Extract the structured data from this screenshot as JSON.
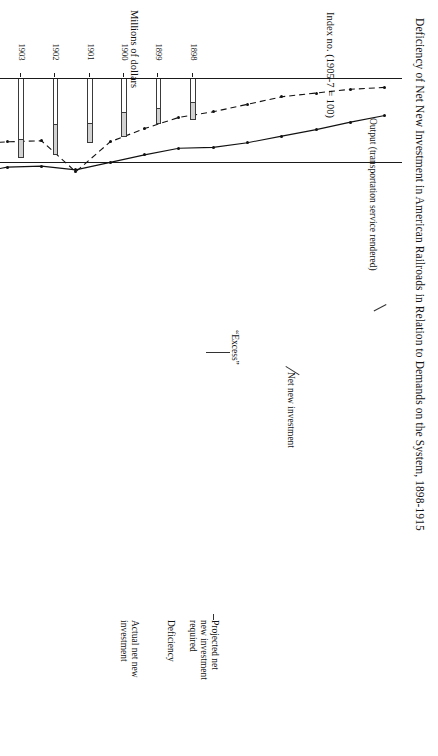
{
  "figure": {
    "title": "Deficiency of Net New Investment in American Railroads in Relation to Demands on the System, 1898-1915"
  },
  "line_panel": {
    "y_caption": "Index no. (1905-7 = 100)",
    "series_label_output": "Output (transportation service rendered)",
    "series_label_investment": "Net new investment"
  },
  "bar_panel": {
    "y_caption": "Millions of dollars",
    "label_projected": "Projected net\nnew investment\nrequired",
    "label_projected_l1": "Projected net",
    "label_projected_l2": "new investment",
    "label_projected_l3": "required",
    "label_deficiency": "Deficiency",
    "label_actual_l1": "Actual net new",
    "label_actual_l2": "investment",
    "label_excess": "“Excess”"
  },
  "chart_data": [
    {
      "type": "line",
      "title": "Index no. (1905-7 = 100)",
      "xlabel": "",
      "ylabel": "Index no. (1905-7 = 100)",
      "ylim": [
        10,
        170
      ],
      "yticks": [
        20,
        40,
        60,
        80,
        100,
        120,
        140,
        160
      ],
      "grid": false,
      "reference_line": 100,
      "legend": "inline annotations",
      "x": [
        1898,
        1899,
        1900,
        1901,
        1902,
        1903,
        1904,
        1905,
        1906,
        1907,
        1908,
        1909,
        1910,
        1911,
        1912,
        1913,
        1914,
        1915
      ],
      "series": [
        {
          "name": "Output (transportation service rendered)",
          "style": "solid",
          "values": [
            50,
            57,
            65,
            72,
            79,
            84,
            85,
            92,
            100,
            108,
            104,
            105,
            112,
            114,
            124,
            137,
            141,
            152
          ]
        },
        {
          "name": "Net new investment",
          "style": "dashed",
          "values": [
            20,
            22,
            26,
            30,
            38,
            46,
            52,
            64,
            78,
            110,
            77,
            78,
            80,
            81,
            44,
            67,
            55,
            74
          ]
        }
      ]
    },
    {
      "type": "bar",
      "subtype": "stacked",
      "title": "Millions of dollars",
      "xlabel": "",
      "ylabel": "Millions of dollars",
      "ylim": [
        0,
        1450
      ],
      "yticks": [
        200,
        400,
        600,
        800,
        1000,
        1200,
        1400
      ],
      "grid": false,
      "categories": [
        1898,
        1899,
        1900,
        1901,
        1902,
        1903,
        1904,
        1905,
        1906,
        1907,
        1908,
        1909,
        1910,
        1911,
        1912,
        1913,
        1914,
        1915
      ],
      "series": [
        {
          "name": "Actual net new investment",
          "fill": "white",
          "values": [
            240,
            300,
            330,
            440,
            450,
            590,
            600,
            650,
            770,
            1020,
            560,
            600,
            620,
            580,
            1170,
            1000,
            800,
            560
          ]
        },
        {
          "name": "Deficiency",
          "fill": "stippled-grey",
          "values": [
            160,
            140,
            230,
            180,
            280,
            170,
            110,
            110,
            90,
            0,
            270,
            220,
            340,
            300,
            80,
            330,
            430,
            820
          ]
        },
        {
          "name": "“Excess”",
          "fill": "hatched",
          "values": [
            0,
            0,
            0,
            0,
            0,
            0,
            0,
            0,
            0,
            130,
            0,
            0,
            0,
            0,
            0,
            0,
            0,
            0
          ]
        }
      ],
      "totals_projected": [
        400,
        440,
        560,
        620,
        730,
        760,
        710,
        760,
        860,
        1020,
        830,
        820,
        960,
        880,
        1250,
        1330,
        1230,
        1380
      ]
    }
  ]
}
